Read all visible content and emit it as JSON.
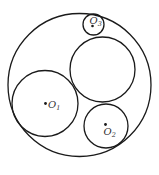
{
  "diagram": {
    "title": "",
    "stroke_color": "#1a1a1a",
    "label_color": "#333333",
    "circles": [
      {
        "id": "outer",
        "cx": 79.5,
        "cy": 85,
        "r": 71.5,
        "label": ""
      },
      {
        "id": "middle",
        "cx": 102.5,
        "cy": 69.5,
        "r": 32.5,
        "label": ""
      },
      {
        "id": "O1",
        "cx": 45,
        "cy": 103.5,
        "r": 33,
        "label": "O",
        "subscript": "1"
      },
      {
        "id": "O2",
        "cx": 106,
        "cy": 126,
        "r": 22,
        "label": "O",
        "subscript": "2"
      },
      {
        "id": "O3",
        "cx": 93.5,
        "cy": 24.5,
        "r": 10.5,
        "label": "O",
        "subscript": "3"
      }
    ],
    "labels": {
      "o1": {
        "main": "O",
        "sub": "1"
      },
      "o2": {
        "main": "O",
        "sub": "2"
      },
      "o3": {
        "main": "O",
        "sub": "3"
      }
    }
  }
}
